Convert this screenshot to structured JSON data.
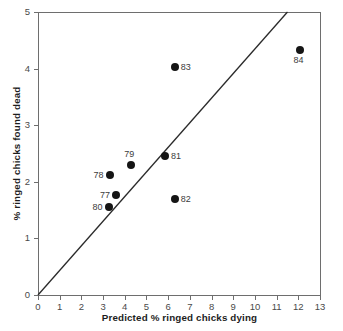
{
  "chart_data": {
    "type": "scatter",
    "title": "",
    "xlabel": "Predicted % ringed chicks dying",
    "ylabel": "% ringed chicks found dead",
    "xlim": [
      0,
      13
    ],
    "ylim": [
      0,
      5
    ],
    "xticks": [
      "0",
      "1",
      "2",
      "3",
      "4",
      "5",
      "6",
      "7",
      "8",
      "9",
      "10",
      "11",
      "12",
      "13"
    ],
    "yticks": [
      "0",
      "1",
      "2",
      "3",
      "4",
      "5"
    ],
    "grid": false,
    "legend": "none",
    "points": [
      {
        "label": "77",
        "x": 3.6,
        "y": 1.77,
        "label_pos": "left"
      },
      {
        "label": "78",
        "x": 3.3,
        "y": 2.12,
        "label_pos": "left"
      },
      {
        "label": "79",
        "x": 4.3,
        "y": 2.3,
        "label_pos": "above"
      },
      {
        "label": "80",
        "x": 3.25,
        "y": 1.55,
        "label_pos": "left"
      },
      {
        "label": "81",
        "x": 5.85,
        "y": 2.45,
        "label_pos": "right"
      },
      {
        "label": "82",
        "x": 6.3,
        "y": 1.7,
        "label_pos": "right"
      },
      {
        "label": "83",
        "x": 6.3,
        "y": 4.03,
        "label_pos": "right"
      },
      {
        "label": "84",
        "x": 12.1,
        "y": 4.33,
        "label_pos": "below"
      }
    ],
    "reference_line": {
      "name": "one-to-one-line",
      "from": [
        0,
        0
      ],
      "to": [
        11.5,
        5
      ]
    },
    "marker_color": "#151515",
    "line_color": "#2a2a2a",
    "axis_color": "#6e6e6e"
  }
}
